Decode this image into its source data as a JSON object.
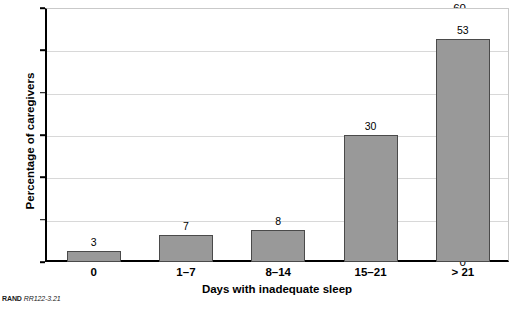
{
  "chart_data": {
    "type": "bar",
    "title": "",
    "subtitle": "",
    "categories": [
      "0",
      "1–7",
      "8–14",
      "15–21",
      "> 21"
    ],
    "values": [
      3,
      7,
      8,
      30,
      53
    ],
    "bar_heights": [
      2.5,
      6.4,
      7.6,
      30.0,
      52.7
    ],
    "data_labels": [
      "3",
      "7",
      "8",
      "30",
      "53"
    ],
    "xlabel": "Days with inadequate sleep",
    "ylabel": "Percentage of caregivers",
    "ylim": [
      0,
      60
    ],
    "xlim": null,
    "yticks": [
      0,
      10,
      20,
      30,
      40,
      50,
      60
    ],
    "ytick_labels": [
      "0",
      "10",
      "20",
      "30",
      "40",
      "50",
      "60"
    ],
    "grid": true,
    "grid_axis": "y",
    "legend": false,
    "legend_position": "none",
    "series": [
      {
        "name": "Percentage of caregivers",
        "values": [
          3,
          7,
          8,
          30,
          53
        ]
      }
    ],
    "colors": {
      "bar_fill": "#999999",
      "bar_edge": "#4a4a4a",
      "axis": "#000000",
      "gridline": "#d8d8d8",
      "text": "#000000",
      "background": "#ffffff"
    }
  },
  "footer": {
    "brand": "RAND",
    "document_id": "RR122-3.21"
  }
}
